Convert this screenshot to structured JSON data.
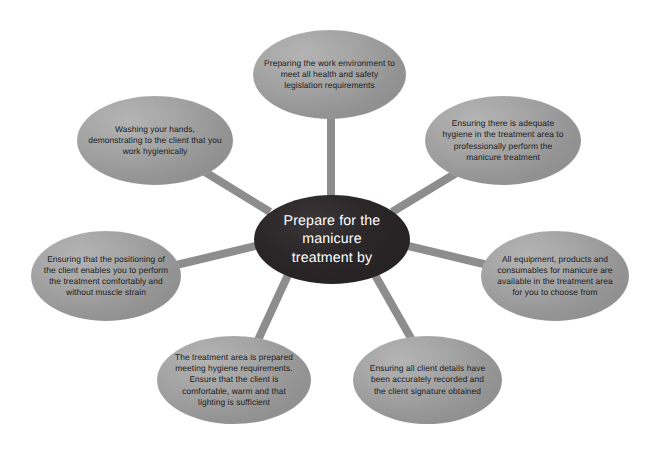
{
  "diagram": {
    "type": "radial-hub-and-spoke",
    "title": "Prepare for the manicure treatment by",
    "background_color": "#ffffff",
    "hub": {
      "label": "Prepare for the manicure treatment by",
      "fill_color": "#231f20",
      "text_color": "#ffffff"
    },
    "connector": {
      "color": "#8d8d8d",
      "width_px": 8
    },
    "satellite_style": {
      "fill_color": "#9a9a9a",
      "text_color": "#1b1b1b"
    },
    "nodes": [
      {
        "id": "top",
        "label": "Preparing the work environment to meet all health and safety legislation requirements"
      },
      {
        "id": "top-right",
        "label": "Ensuring there is adequate hygiene in the treatment area to professionally perform the manicure treatment"
      },
      {
        "id": "right",
        "label": "All equipment, products and consumables for manicure are available in the treatment area for you to choose from"
      },
      {
        "id": "bottom-right",
        "label": "Ensuring all client details have been accurately recorded and the client signature obtained"
      },
      {
        "id": "bottom-left",
        "label": "The treatment area is prepared meeting hygiene requirements. Ensure that the client is comfortable, warm and that lighting is sufficient"
      },
      {
        "id": "left",
        "label": "Ensuring that the positioning of the client enables you to perform the treatment comfortably and without muscle strain"
      },
      {
        "id": "top-left",
        "label": "Washing your hands, demonstrating to the client that you work hygienically"
      }
    ]
  }
}
